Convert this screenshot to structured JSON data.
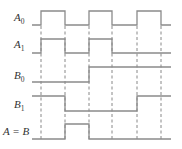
{
  "diagram": {
    "type": "timing-diagram",
    "colors": {
      "waveform": "#8a8a8a",
      "guide": "#7a7a7a",
      "label": "#333333",
      "background": "#ffffff"
    },
    "time_edges_x": [
      41,
      65,
      89,
      112,
      137,
      161
    ],
    "x_start": 32,
    "x_end": 171,
    "signals": [
      {
        "id": "A0",
        "name": "A",
        "subscript": "0",
        "label_x": 14,
        "label_y": 21,
        "high_y": 11,
        "low_y": 25,
        "levels": [
          0,
          1,
          0,
          1,
          0,
          1,
          0
        ]
      },
      {
        "id": "A1",
        "name": "A",
        "subscript": "1",
        "label_x": 14,
        "label_y": 48,
        "high_y": 39,
        "low_y": 53,
        "levels": [
          0,
          1,
          0,
          1,
          0,
          0,
          0
        ]
      },
      {
        "id": "B0",
        "name": "B",
        "subscript": "0",
        "label_x": 14,
        "label_y": 79,
        "high_y": 67,
        "low_y": 82,
        "levels": [
          0,
          0,
          0,
          1,
          1,
          1,
          1
        ]
      },
      {
        "id": "B1",
        "name": "B",
        "subscript": "1",
        "label_x": 14,
        "label_y": 108,
        "high_y": 96,
        "low_y": 111,
        "levels": [
          1,
          1,
          0,
          0,
          0,
          1,
          1
        ]
      },
      {
        "id": "AeqB",
        "name": "A = B",
        "subscript": "",
        "label_x": 3,
        "label_y": 135,
        "high_y": 124,
        "low_y": 139,
        "levels": [
          0,
          0,
          1,
          0,
          0,
          0,
          0
        ]
      }
    ]
  }
}
